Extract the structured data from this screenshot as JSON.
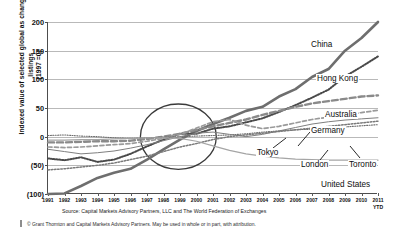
{
  "chart_data": {
    "type": "line",
    "title": "",
    "xlabel": "",
    "ylabel": "Indexed value of selected global as change listings\n(1997 =0)",
    "ylim": [
      -100,
      200
    ],
    "yticks": [
      200,
      150,
      100,
      50,
      0,
      -50,
      -100
    ],
    "ytick_labels": [
      "200",
      "150",
      "100",
      "50",
      "0",
      "(50)",
      "(100)"
    ],
    "grid": true,
    "legend_position": "inline-right-labels",
    "x": [
      1991,
      1992,
      1993,
      1994,
      1995,
      1996,
      1997,
      1998,
      1999,
      2000,
      2001,
      2002,
      2003,
      2004,
      2005,
      2006,
      2007,
      2008,
      2009,
      2010,
      2011
    ],
    "xtick_labels": [
      "1991",
      "1992",
      "1993",
      "1994",
      "1995",
      "1996",
      "1997",
      "1998",
      "1999",
      "2000",
      "2001",
      "2002",
      "2003",
      "2004",
      "2005",
      "2006",
      "2007",
      "2008",
      "2009",
      "2010",
      "2011"
    ],
    "xtick_sublabel_last": "YTD",
    "annotations": [
      {
        "type": "ellipse",
        "note": "highlight circle around 1997-2001 crossover near index 0",
        "center_x": 1998.9,
        "center_y": 0,
        "radius_x_years": 2.3,
        "radius_y_index": 57
      }
    ],
    "series": [
      {
        "name": "China",
        "style": "solid-thick",
        "color": "#6e6e6e",
        "values": [
          -100,
          -99,
          -86,
          -72,
          -63,
          -56,
          -40,
          -22,
          -5,
          10,
          22,
          33,
          45,
          52,
          70,
          83,
          104,
          118,
          150,
          172,
          200
        ]
      },
      {
        "name": "Hong Kong",
        "style": "dotted",
        "color": "#4a4a4a",
        "values": [
          -38,
          -41,
          -36,
          -44,
          -40,
          -30,
          -17,
          -5,
          5,
          5,
          14,
          18,
          25,
          32,
          43,
          55,
          68,
          82,
          105,
          122,
          140
        ]
      },
      {
        "name": "Australia",
        "style": "dashed-thick",
        "color": "#8a8a8a",
        "values": [
          -10,
          -10,
          -9,
          -8,
          -8,
          -7,
          -4,
          0,
          5,
          12,
          18,
          24,
          30,
          38,
          45,
          52,
          58,
          62,
          66,
          70,
          72
        ]
      },
      {
        "name": "Germany",
        "style": "dashed-medium",
        "color": "#9a9a9a",
        "values": [
          -18,
          -19,
          -18,
          -16,
          -14,
          -12,
          -8,
          -3,
          4,
          15,
          26,
          30,
          20,
          14,
          18,
          24,
          30,
          34,
          38,
          42,
          46
        ]
      },
      {
        "name": "Tokyo",
        "style": "dotted-fine",
        "color": "#6d6d6d",
        "values": [
          2,
          3,
          1,
          0,
          -2,
          -3,
          -2,
          -1,
          0,
          1,
          2,
          3,
          5,
          8,
          10,
          12,
          13,
          15,
          17,
          19,
          21
        ]
      },
      {
        "name": "London",
        "style": "solid-thin",
        "color": "#7f7f7f",
        "values": [
          -22,
          -26,
          -30,
          -28,
          -25,
          -20,
          -14,
          -7,
          0,
          6,
          8,
          4,
          0,
          4,
          10,
          16,
          22,
          26,
          29,
          31,
          33
        ]
      },
      {
        "name": "Toronto",
        "style": "dotted-medium",
        "color": "#7a7a7a",
        "values": [
          -58,
          -56,
          -53,
          -50,
          -46,
          -40,
          -34,
          -26,
          -18,
          -12,
          -5,
          0,
          3,
          6,
          9,
          12,
          15,
          18,
          21,
          24,
          27
        ]
      },
      {
        "name": "United States",
        "style": "solid-thin-light",
        "color": "#a5a5a5",
        "values": [
          -6,
          -6,
          -5,
          -5,
          -4,
          -3,
          -2,
          -2,
          -3,
          -8,
          -16,
          -24,
          -30,
          -34,
          -37,
          -39,
          -40,
          -41,
          -41,
          -41,
          -41
        ]
      }
    ]
  },
  "series_labels": [
    {
      "name": "China",
      "text": "China"
    },
    {
      "name": "Hong Kong",
      "text": "Hong Kong"
    },
    {
      "name": "Australia",
      "text": "Australia"
    },
    {
      "name": "Germany",
      "text": "Germany"
    },
    {
      "name": "Tokyo",
      "text": "Tokyo"
    },
    {
      "name": "London",
      "text": "London"
    },
    {
      "name": "Toronto",
      "text": "Toronto"
    },
    {
      "name": "United States",
      "text": "United States"
    }
  ],
  "footer": {
    "source": "Source: Capital Markets Advisory Partners, LLC and The World Federation of Exchanges",
    "copyright": "© Grant Thornton and Capital Markets Advisory Partners. May be used in whole or in part, with attribution."
  }
}
